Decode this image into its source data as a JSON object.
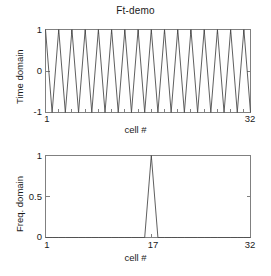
{
  "figure": {
    "title": "Ft-demo",
    "background_color": "#ffffff",
    "line_color": "#4d4d4d",
    "axis_color": "#808080",
    "text_color": "#1a1a1a"
  },
  "top_plot": {
    "ylabel": "Time domain",
    "xlabel": "cell #",
    "yticks": [
      "1",
      "0",
      "-1"
    ],
    "xticks": [
      "1",
      "32"
    ]
  },
  "bottom_plot": {
    "ylabel": "Freq. domain",
    "xlabel": "cell #",
    "yticks": [
      "1",
      "0.5",
      "0"
    ],
    "xticks": [
      "1",
      "17",
      "32"
    ]
  },
  "chart_data": [
    {
      "type": "line",
      "title": "Ft-demo",
      "xlabel": "cell #",
      "ylabel": "Time domain",
      "xlim": [
        1,
        32
      ],
      "ylim": [
        -1,
        1
      ],
      "xticks": [
        1,
        32
      ],
      "yticks": [
        -1,
        0,
        1
      ],
      "grid": false,
      "legend": null,
      "x": [
        1,
        2,
        3,
        4,
        5,
        6,
        7,
        8,
        9,
        10,
        11,
        12,
        13,
        14,
        15,
        16,
        17,
        18,
        19,
        20,
        21,
        22,
        23,
        24,
        25,
        26,
        27,
        28,
        29,
        30,
        31,
        32
      ],
      "values": [
        1,
        -1,
        1,
        -1,
        1,
        -1,
        1,
        -1,
        1,
        -1,
        1,
        -1,
        1,
        -1,
        1,
        -1,
        1,
        -1,
        1,
        -1,
        1,
        -1,
        1,
        -1,
        1,
        -1,
        1,
        -1,
        1,
        -1,
        1,
        -1
      ],
      "note": "alternating +1/-1 sampled cosine at Nyquist-like frequency, 16 cycles over 32 cells"
    },
    {
      "type": "line",
      "title": "",
      "xlabel": "cell #",
      "ylabel": "Freq. domain",
      "xlim": [
        1,
        32
      ],
      "ylim": [
        0,
        1
      ],
      "xticks": [
        1,
        17,
        32
      ],
      "yticks": [
        0,
        0.5,
        1
      ],
      "grid": false,
      "legend": null,
      "x": [
        1,
        2,
        3,
        4,
        5,
        6,
        7,
        8,
        9,
        10,
        11,
        12,
        13,
        14,
        15,
        16,
        17,
        18,
        19,
        20,
        21,
        22,
        23,
        24,
        25,
        26,
        27,
        28,
        29,
        30,
        31,
        32
      ],
      "values": [
        0,
        0,
        0,
        0,
        0,
        0,
        0,
        0,
        0,
        0,
        0,
        0,
        0,
        0,
        0,
        0,
        1,
        0,
        0,
        0,
        0,
        0,
        0,
        0,
        0,
        0,
        0,
        0,
        0,
        0,
        0,
        0
      ],
      "note": "single spectral spike of magnitude 1 at cell 17"
    }
  ]
}
